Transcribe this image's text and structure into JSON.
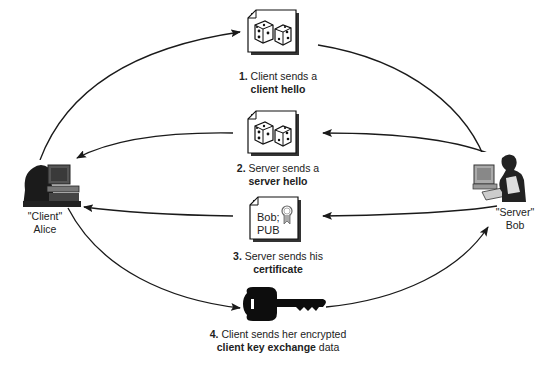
{
  "diagram": {
    "type": "tls-handshake-flow",
    "actors": {
      "client": {
        "role": "\"Client\"",
        "name": "Alice",
        "icon": "person-at-computer-icon"
      },
      "server": {
        "role": "\"Server\"",
        "name": "Bob",
        "icon": "person-at-computer-icon"
      }
    },
    "steps": [
      {
        "number": "1.",
        "text": "Client sends a",
        "bold": "client hello",
        "suffix": "",
        "direction": "client-to-server",
        "icon": "dice-document-icon"
      },
      {
        "number": "2.",
        "text": "Server sends a",
        "bold": "server hello",
        "suffix": "",
        "direction": "server-to-client",
        "icon": "dice-document-icon"
      },
      {
        "number": "3.",
        "text": "Server sends his",
        "bold": "certificate",
        "suffix": "",
        "direction": "server-to-client",
        "icon": "certificate-document-icon"
      },
      {
        "number": "4.",
        "text": "Client sends her encrypted",
        "bold": "client key exchange",
        "suffix": " data",
        "direction": "client-to-server",
        "icon": "key-icon"
      }
    ],
    "certificate": {
      "line1": "Bob;",
      "line2": "PUB"
    },
    "colors": {
      "line": "#1a1a1a",
      "doc_fill": "#ffffff",
      "doc_shadow": "#333333",
      "key": "#0d0d0d"
    }
  }
}
